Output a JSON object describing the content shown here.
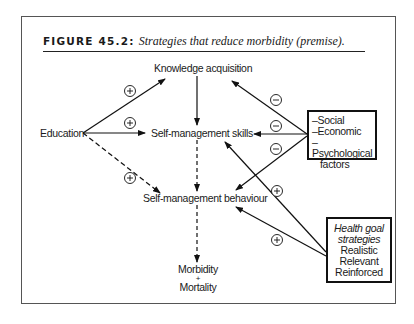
{
  "figure": {
    "label": "FIGURE 45.2:",
    "caption": "Strategies that reduce morbidity (premise)."
  },
  "nodes": {
    "knowledge": "Knowledge acquisition",
    "education": "Education",
    "skills": "Self-management skills",
    "behaviour": "Self-management behaviour",
    "morbidity": "Morbidity",
    "plus_sign": "+",
    "mortality": "Mortality"
  },
  "factors_box": {
    "items": [
      "–Social",
      "–Economic",
      "–Psychological",
      "factors"
    ]
  },
  "health_box": {
    "title_line1": "Health goal",
    "title_line2": "strategies",
    "items": [
      "Realistic",
      "Relevant",
      "Reinforced"
    ]
  },
  "edges": [
    {
      "from": "Education",
      "to": "Knowledge acquisition",
      "sign": "+",
      "style": "solid"
    },
    {
      "from": "Education",
      "to": "Self-management skills",
      "sign": "+",
      "style": "solid"
    },
    {
      "from": "Education",
      "to": "Self-management behaviour",
      "sign": "+",
      "style": "dashed"
    },
    {
      "from": "Knowledge acquisition",
      "to": "Self-management skills",
      "sign": "",
      "style": "solid"
    },
    {
      "from": "Self-management skills",
      "to": "Self-management behaviour",
      "sign": "",
      "style": "dashed"
    },
    {
      "from": "Self-management behaviour",
      "to": "Morbidity + Mortality",
      "sign": "",
      "style": "dashed"
    },
    {
      "from": "Social/Economic/Psychological factors",
      "to": "Knowledge acquisition",
      "sign": "−",
      "style": "solid"
    },
    {
      "from": "Social/Economic/Psychological factors",
      "to": "Self-management skills",
      "sign": "−",
      "style": "solid"
    },
    {
      "from": "Social/Economic/Psychological factors",
      "to": "Self-management behaviour",
      "sign": "−",
      "style": "solid"
    },
    {
      "from": "Health goal strategies",
      "to": "Self-management skills",
      "sign": "+",
      "style": "solid"
    },
    {
      "from": "Health goal strategies",
      "to": "Self-management behaviour",
      "sign": "+",
      "style": "solid"
    }
  ],
  "signs": {
    "plus": "+",
    "minus": "−"
  }
}
